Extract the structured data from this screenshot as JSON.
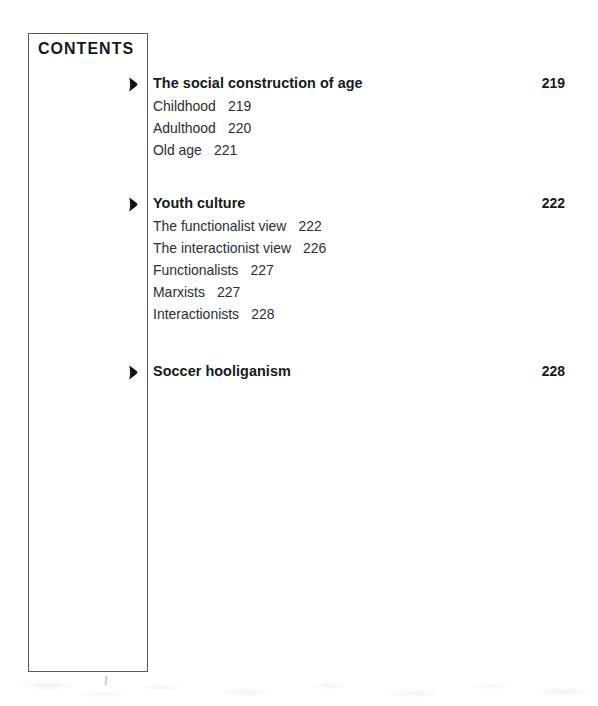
{
  "page": {
    "box_title": "CONTENTS",
    "bullet_icon": "solid-arrowhead-bullet"
  },
  "sections": [
    {
      "heading": "The social construction of age",
      "page": "219",
      "items": [
        {
          "label": "Childhood",
          "page": "219"
        },
        {
          "label": "Adulthood",
          "page": "220"
        },
        {
          "label": "Old age",
          "page": "221"
        }
      ]
    },
    {
      "heading": "Youth culture",
      "page": "222",
      "items": [
        {
          "label": "The functionalist view",
          "page": "222"
        },
        {
          "label": "The interactionist view",
          "page": "226"
        },
        {
          "label": "Functionalists",
          "page": "227"
        },
        {
          "label": "Marxists",
          "page": "227"
        },
        {
          "label": "Interactionists",
          "page": "228"
        }
      ]
    },
    {
      "heading": "Soccer hooliganism",
      "page": "228",
      "items": []
    }
  ],
  "layout": {
    "section_tops": [
      74,
      194,
      362
    ],
    "subitem_start_offset": 23,
    "subitem_line_height": 22
  },
  "colors": {
    "ink": "#16191c",
    "sub_ink": "#2b2f33",
    "rule": "#555a5e",
    "paper": "#ffffff"
  }
}
